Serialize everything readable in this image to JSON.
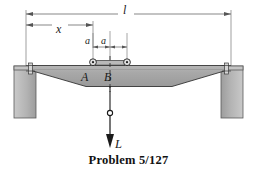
{
  "figure": {
    "caption": "Problem 5/127",
    "title_label": "Problem 5/127",
    "labels": {
      "span_l": "l",
      "distance_x": "x",
      "half_gap_a_left": "a",
      "half_gap_a_right": "a",
      "point_A": "A",
      "point_B": "B",
      "load_L": "L"
    },
    "colors": {
      "beam_fill": "#a9a9a9",
      "beam_stroke": "#2b2b2b",
      "wall_fill": "#b0b0b0",
      "wall_stroke": "#4a4a4a",
      "dimension_line": "#555555",
      "centerline": "#333333",
      "background": "#ffffff",
      "text": "#111111"
    },
    "elements": {
      "left_wall": "left-support-wall",
      "right_wall": "right-support-wall",
      "beam": "tapered-beam",
      "left_roller": "roller-pin-A",
      "right_roller": "roller-pin-B",
      "trolley": "trolley-bar",
      "center_dashed_line": "centerline",
      "load_cable": "load-cable",
      "load_hook": "load-hook",
      "load_arrow": "load-arrow"
    }
  }
}
